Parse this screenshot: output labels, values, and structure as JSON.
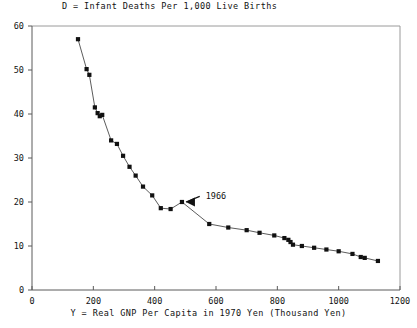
{
  "chart_data": {
    "type": "scatter",
    "title": "D = Infant Deaths Per 1,000 Live Births",
    "xlabel": "Y = Real GNP Per Capita in 1970 Yen (Thousand Yen)",
    "ylabel": "",
    "xlim": [
      0,
      1200
    ],
    "ylim": [
      0,
      60
    ],
    "xticks": [
      0,
      200,
      400,
      600,
      800,
      1000,
      1200
    ],
    "yticks": [
      0,
      10,
      20,
      30,
      40,
      50,
      60
    ],
    "xtick_labels": [
      "0",
      "200",
      "400",
      "600",
      "800",
      "1000",
      "1200"
    ],
    "ytick_labels": [
      "0",
      "10",
      "20",
      "30",
      "40",
      "50",
      "60"
    ],
    "grid": false,
    "legend": null,
    "marker": "filled-square",
    "line": "connected",
    "x": [
      150,
      178,
      187,
      205,
      214,
      221,
      229,
      258,
      277,
      297,
      318,
      338,
      362,
      392,
      420,
      452,
      489,
      578,
      640,
      700,
      742,
      790,
      823,
      836,
      843,
      851,
      880,
      920,
      960,
      1000,
      1045,
      1072,
      1085,
      1128
    ],
    "values": [
      57.0,
      50.2,
      48.9,
      41.5,
      40.2,
      39.5,
      39.8,
      34.0,
      33.2,
      30.5,
      28.0,
      26.0,
      23.5,
      21.5,
      18.6,
      18.4,
      20.0,
      15.0,
      14.2,
      13.6,
      13.0,
      12.4,
      11.8,
      11.4,
      10.9,
      10.3,
      10.0,
      9.6,
      9.2,
      8.8,
      8.2,
      7.5,
      7.3,
      6.6
    ],
    "annotations": [
      {
        "text": "1966",
        "x": 489,
        "y": 20.0,
        "label_x": 560,
        "label_y": 21.5,
        "arrow": "left-pointing"
      }
    ]
  },
  "axes": {
    "left_border": true,
    "right_border": true,
    "top_border": true,
    "bottom_border": true
  }
}
